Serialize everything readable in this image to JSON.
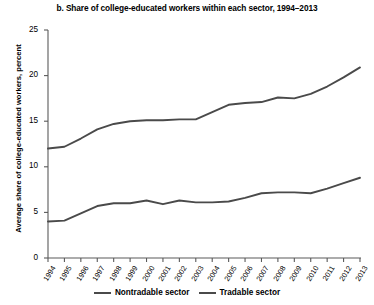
{
  "chart_data": {
    "type": "line",
    "title": "b. Share of college-educated workers within each sector, 1994–2013",
    "xlabel": "",
    "ylabel": "Average share of college-educated workers, percent",
    "x": [
      1994,
      1995,
      1996,
      1997,
      1998,
      1999,
      2000,
      2001,
      2002,
      2003,
      2004,
      2005,
      2006,
      2007,
      2008,
      2009,
      2010,
      2011,
      2012,
      2013
    ],
    "categories": [
      "1994",
      "1995",
      "1996",
      "1997",
      "1998",
      "1999",
      "2000",
      "2001",
      "2002",
      "2003",
      "2004",
      "2005",
      "2006",
      "2007",
      "2008",
      "2009",
      "2010",
      "2011",
      "2012",
      "2013"
    ],
    "ylim": [
      0,
      25
    ],
    "yticks": [
      0,
      5,
      10,
      15,
      20,
      25
    ],
    "ytick_labels": [
      "0",
      "5",
      "10",
      "15",
      "20",
      "25"
    ],
    "grid": false,
    "legend_position": "bottom",
    "series": [
      {
        "name": "Nontradable sector",
        "color": "#4a4a4a",
        "values": [
          12.0,
          12.2,
          13.1,
          14.1,
          14.7,
          15.0,
          15.1,
          15.1,
          15.2,
          15.2,
          16.0,
          16.8,
          17.0,
          17.1,
          17.6,
          17.5,
          18.0,
          18.8,
          19.8,
          20.9
        ]
      },
      {
        "name": "Tradable sector",
        "color": "#4a4a4a",
        "values": [
          4.0,
          4.1,
          4.9,
          5.7,
          6.0,
          6.0,
          6.3,
          5.9,
          6.3,
          6.1,
          6.1,
          6.2,
          6.6,
          7.1,
          7.2,
          7.2,
          7.1,
          7.6,
          8.2,
          8.8
        ]
      }
    ],
    "legend": [
      "Nontradable sector",
      "Tradable sector"
    ]
  },
  "axes": {
    "plot_left": 48,
    "plot_right": 360,
    "plot_top": 30,
    "plot_bottom": 258
  }
}
